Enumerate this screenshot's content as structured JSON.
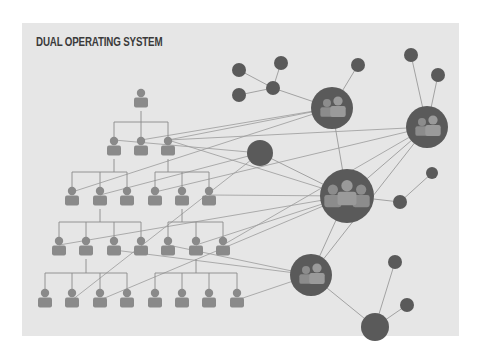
{
  "title": "DUAL OPERATING SYSTEM",
  "colors": {
    "background": "#ffffff",
    "panel": "#e6e6e6",
    "title": "#3a3a3a",
    "person": "#8a8a8a",
    "hierarchy_line": "#8a8a8a",
    "network_node": "#5a5a5a",
    "network_line": "#9a9a9a",
    "group_icon": "#8c8c8c"
  },
  "hierarchy": {
    "label": "Hierarchy",
    "levels": [
      {
        "y": 97,
        "x": [
          141
        ]
      },
      {
        "y": 145,
        "x": [
          114,
          141,
          168
        ]
      },
      {
        "y": 195,
        "x": [
          72,
          100,
          127,
          155,
          182,
          209
        ]
      },
      {
        "y": 245,
        "x": [
          59,
          86,
          114,
          141,
          168,
          196,
          223
        ]
      },
      {
        "y": 297,
        "x": [
          45,
          72,
          100,
          127,
          155,
          182,
          209,
          237
        ]
      }
    ],
    "branches": [
      {
        "parent": [
          141,
          97
        ],
        "children": [
          114,
          141,
          168
        ],
        "child_y": 145,
        "bar_y": 122
      },
      {
        "parent": [
          114,
          145
        ],
        "children": [
          72,
          100,
          127
        ],
        "child_y": 195,
        "bar_y": 172
      },
      {
        "parent": [
          168,
          145
        ],
        "children": [
          155,
          182,
          209
        ],
        "child_y": 195,
        "bar_y": 172
      },
      {
        "parent": [
          100,
          195
        ],
        "children": [
          59,
          86,
          114,
          141
        ],
        "child_y": 245,
        "bar_y": 222
      },
      {
        "parent": [
          182,
          195
        ],
        "children": [
          168,
          196,
          223
        ],
        "child_y": 245,
        "bar_y": 222
      },
      {
        "parent": [
          86,
          245
        ],
        "children": [
          45,
          72,
          100,
          127
        ],
        "child_y": 297,
        "bar_y": 273
      },
      {
        "parent": [
          196,
          245
        ],
        "children": [
          155,
          182,
          209,
          237
        ],
        "child_y": 297,
        "bar_y": 273
      }
    ]
  },
  "network": {
    "label": "Network",
    "groups": [
      {
        "id": "A",
        "x": 332,
        "y": 108,
        "r": 21,
        "people": 2
      },
      {
        "id": "B",
        "x": 427,
        "y": 127,
        "r": 21,
        "people": 2
      },
      {
        "id": "C",
        "x": 347,
        "y": 196,
        "r": 27,
        "people": 3
      },
      {
        "id": "D",
        "x": 311,
        "y": 275,
        "r": 21,
        "people": 2
      }
    ],
    "nodes": [
      {
        "id": "E",
        "x": 260,
        "y": 153,
        "r": 13
      },
      {
        "id": "F",
        "x": 375,
        "y": 327,
        "r": 14
      },
      {
        "id": "n1",
        "x": 239,
        "y": 70,
        "r": 7
      },
      {
        "id": "n2",
        "x": 281,
        "y": 63,
        "r": 7
      },
      {
        "id": "n3",
        "x": 239,
        "y": 95,
        "r": 7
      },
      {
        "id": "n4",
        "x": 273,
        "y": 88,
        "r": 7
      },
      {
        "id": "n5",
        "x": 358,
        "y": 65,
        "r": 7
      },
      {
        "id": "n6",
        "x": 411,
        "y": 55,
        "r": 7
      },
      {
        "id": "n7",
        "x": 438,
        "y": 75,
        "r": 7
      },
      {
        "id": "n8",
        "x": 432,
        "y": 173,
        "r": 6
      },
      {
        "id": "n9",
        "x": 400,
        "y": 202,
        "r": 7
      },
      {
        "id": "n10",
        "x": 395,
        "y": 262,
        "r": 7
      },
      {
        "id": "n11",
        "x": 407,
        "y": 305,
        "r": 7
      }
    ],
    "links": [
      [
        239,
        70,
        273,
        88
      ],
      [
        281,
        63,
        273,
        88
      ],
      [
        239,
        95,
        273,
        88
      ],
      [
        273,
        88,
        332,
        108
      ],
      [
        358,
        65,
        332,
        108
      ],
      [
        411,
        55,
        427,
        127
      ],
      [
        438,
        75,
        427,
        127
      ],
      [
        332,
        108,
        347,
        196
      ],
      [
        427,
        127,
        347,
        196
      ],
      [
        427,
        127,
        311,
        275
      ],
      [
        347,
        196,
        311,
        275
      ],
      [
        347,
        196,
        400,
        202
      ],
      [
        400,
        202,
        432,
        173
      ],
      [
        311,
        275,
        375,
        327
      ],
      [
        375,
        327,
        395,
        262
      ],
      [
        375,
        327,
        407,
        305
      ],
      [
        260,
        153,
        347,
        196
      ]
    ],
    "cross_links": [
      [
        168,
        140,
        332,
        108
      ],
      [
        141,
        140,
        332,
        108
      ],
      [
        168,
        140,
        427,
        127
      ],
      [
        114,
        140,
        260,
        153
      ],
      [
        168,
        140,
        347,
        196
      ],
      [
        72,
        192,
        332,
        108
      ],
      [
        155,
        192,
        427,
        127
      ],
      [
        209,
        195,
        347,
        196
      ],
      [
        100,
        195,
        260,
        153
      ],
      [
        59,
        245,
        347,
        196
      ],
      [
        168,
        245,
        311,
        275
      ],
      [
        196,
        245,
        347,
        196
      ],
      [
        223,
        245,
        427,
        127
      ],
      [
        114,
        250,
        311,
        275
      ],
      [
        72,
        300,
        260,
        153
      ],
      [
        237,
        300,
        311,
        275
      ],
      [
        100,
        300,
        347,
        196
      ]
    ]
  }
}
